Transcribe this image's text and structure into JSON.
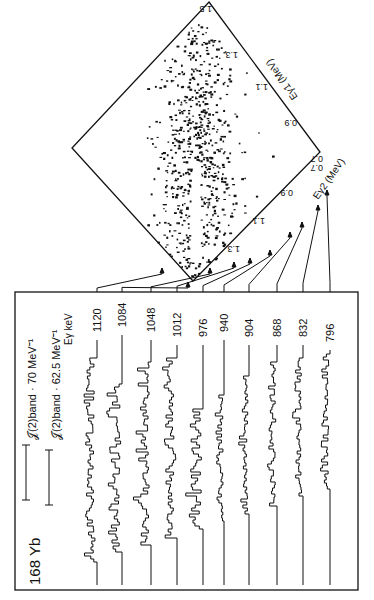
{
  "figure": {
    "nucleus": {
      "mass": "168",
      "symbol": "Yb"
    },
    "legend": [
      {
        "label": "𝒥(2)band · 70 MeV⁻¹",
        "moment": "70 MeV⁻¹"
      },
      {
        "label": "𝒥(2)band · 62.5 MeV⁻¹",
        "moment": "62.5 MeV⁻¹"
      }
    ],
    "energy_axis_label": "Eγ keV",
    "matrix": {
      "x_axis_label": "Eγ1 (MeV)",
      "y_axis_label": "Eγ2 (MeV)",
      "x_ticks": [
        "0.7",
        "0.9",
        "1.1",
        "1.3",
        "1.5"
      ],
      "y_ticks": [
        "0.7",
        "0.9",
        "1.1",
        "1.3",
        "1.5"
      ]
    },
    "spectra_gates_keV": [
      "1120",
      "1084",
      "1048",
      "1012",
      "976",
      "940",
      "904",
      "868",
      "832",
      "796"
    ]
  },
  "chart_data": {
    "type": "heatmap",
    "xlabel": "Eγ1 (MeV)",
    "ylabel": "Eγ2 (MeV)",
    "xlim": [
      0.7,
      1.5
    ],
    "ylim": [
      0.7,
      1.5
    ],
    "ticks": [
      0.7,
      0.9,
      1.1,
      1.3,
      1.5
    ],
    "gated_spectra": {
      "gates_keV": [
        1120,
        1084,
        1048,
        1012,
        976,
        940,
        904,
        868,
        832,
        796
      ],
      "legend": [
        "J(2)band = 70 MeV^-1",
        "J(2)band = 62.5 MeV^-1"
      ]
    }
  }
}
